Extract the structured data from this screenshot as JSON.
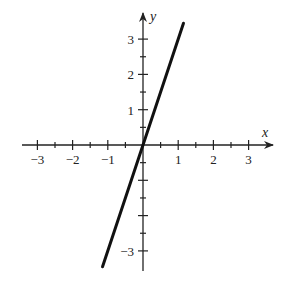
{
  "chart_data": {
    "type": "line",
    "title": "",
    "xlabel": "x",
    "ylabel": "y",
    "xlim": [
      -3.4,
      3.7
    ],
    "ylim": [
      -3.6,
      3.7
    ],
    "x_ticks": [
      -3,
      -2,
      -1,
      1,
      2,
      3
    ],
    "y_ticks": [
      -3,
      1,
      2,
      3
    ],
    "minor_tick_step": 0.5,
    "grid": false,
    "series": [
      {
        "name": "y = 3x",
        "x": [
          -1.15,
          1.15
        ],
        "y": [
          -3.45,
          3.45
        ],
        "color": "#111111"
      }
    ]
  },
  "labels": {
    "x_axis": "x",
    "y_axis": "y",
    "x_tick_labels": [
      "−3",
      "−2",
      "−1",
      "1",
      "2",
      "3"
    ],
    "y_tick_labels": [
      "3",
      "2",
      "1",
      "−3"
    ]
  }
}
